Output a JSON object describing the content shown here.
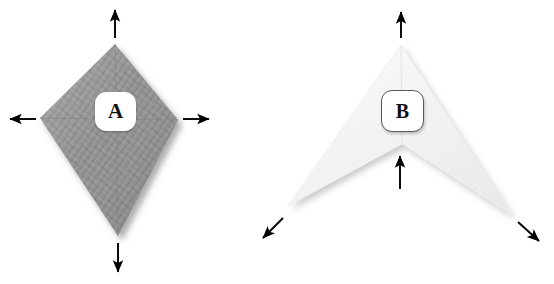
{
  "canvas": {
    "width": 554,
    "height": 284,
    "background_color": "#ffffff",
    "clipped_caption_top": ""
  },
  "figure": {
    "shapes": [
      {
        "id": "A",
        "label": "A",
        "name": "kite-polygon",
        "kind": "convex-kite",
        "fill_color": "#8f8f8f",
        "texture": "cross-hatch-weave",
        "shadow_color": "#c9c9c9",
        "points": "115,44 178,120 118,236 40,118",
        "badge_style": "white-fill-no-border",
        "arrows": [
          {
            "name": "arrow-up",
            "direction": "up",
            "x1": 115,
            "y1": 38,
            "x2": 115,
            "y2": 8
          },
          {
            "name": "arrow-left",
            "direction": "left",
            "x1": 36,
            "y1": 119,
            "x2": 8,
            "y2": 119
          },
          {
            "name": "arrow-right",
            "direction": "right",
            "x1": 183,
            "y1": 119,
            "x2": 211,
            "y2": 119
          },
          {
            "name": "arrow-down",
            "direction": "down",
            "x1": 118,
            "y1": 243,
            "x2": 118,
            "y2": 274
          }
        ]
      },
      {
        "id": "B",
        "label": "B",
        "name": "chevron-dart-polygon",
        "kind": "concave-dart",
        "fill_color": "#f2f2f2",
        "texture": "faint-weave",
        "shadow_color": "#d7d7d7",
        "points": "401,45 513,216 402,144 288,206",
        "badge_style": "white-fill-dark-border",
        "arrows": [
          {
            "name": "arrow-up",
            "direction": "up",
            "x1": 401,
            "y1": 38,
            "x2": 401,
            "y2": 10
          },
          {
            "name": "arrow-up-inner-notch",
            "direction": "up",
            "x1": 400,
            "y1": 189,
            "x2": 400,
            "y2": 154
          },
          {
            "name": "arrow-down-left",
            "direction": "down-left",
            "x1": 283,
            "y1": 218,
            "x2": 261,
            "y2": 240
          },
          {
            "name": "arrow-down-right",
            "direction": "down-right",
            "x1": 518,
            "y1": 222,
            "x2": 541,
            "y2": 243
          }
        ]
      }
    ]
  },
  "colors": {
    "shape_a_fill": "#8f8f8f",
    "shape_b_fill": "#f2f2f2",
    "arrow_color": "#000000",
    "badge_text": "#111111",
    "background": "#ffffff"
  }
}
